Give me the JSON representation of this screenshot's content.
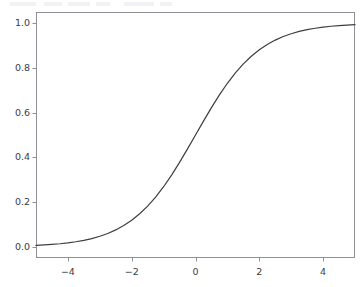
{
  "figure": {
    "width": 363,
    "height": 287,
    "background_color": "#ffffff"
  },
  "top_strip": {
    "present": true,
    "description": "cropped-toolbar-remnant"
  },
  "chart_data": {
    "type": "line",
    "title": "",
    "subtitle": "",
    "xlabel": "",
    "ylabel": "",
    "xlim": [
      -5.0,
      5.0
    ],
    "ylim": [
      -0.0496,
      1.0496
    ],
    "grid": false,
    "legend": null,
    "legend_position": "none",
    "xticks": [
      -4,
      -2,
      0,
      2,
      4
    ],
    "xticklabels": [
      "−4",
      "−2",
      "0",
      "2",
      "4"
    ],
    "yticks": [
      0.0,
      0.2,
      0.4,
      0.6,
      0.8,
      1.0
    ],
    "yticklabels": [
      "0.0",
      "0.2",
      "0.4",
      "0.6",
      "0.8",
      "1.0"
    ],
    "series": [
      {
        "name": "sigmoid",
        "function": "1 / (1 + exp(-x))",
        "color": "#3d3d44",
        "linewidth": 1.2,
        "linestyle": "solid",
        "marker": "none",
        "x": [
          -5.0,
          -4.75,
          -4.5,
          -4.25,
          -4.0,
          -3.75,
          -3.5,
          -3.25,
          -3.0,
          -2.75,
          -2.5,
          -2.25,
          -2.0,
          -1.75,
          -1.5,
          -1.25,
          -1.0,
          -0.75,
          -0.5,
          -0.25,
          0.0,
          0.25,
          0.5,
          0.75,
          1.0,
          1.25,
          1.5,
          1.75,
          2.0,
          2.25,
          2.5,
          2.75,
          3.0,
          3.25,
          3.5,
          3.75,
          4.0,
          4.25,
          4.5,
          4.75,
          5.0
        ],
        "y": [
          0.0067,
          0.0086,
          0.011,
          0.014,
          0.018,
          0.023,
          0.0293,
          0.0373,
          0.0474,
          0.0601,
          0.0759,
          0.0953,
          0.1192,
          0.148,
          0.1824,
          0.2227,
          0.2689,
          0.3208,
          0.3775,
          0.4378,
          0.5,
          0.5622,
          0.6225,
          0.6792,
          0.7311,
          0.7773,
          0.8176,
          0.852,
          0.8808,
          0.9045,
          0.9241,
          0.9399,
          0.9526,
          0.9627,
          0.9707,
          0.977,
          0.982,
          0.986,
          0.989,
          0.9914,
          0.9933
        ]
      }
    ]
  },
  "axes": {
    "spine_color": "#8f8f97",
    "tick_color": "#8f8f97",
    "tick_label_color": "#3b3b42",
    "frame": {
      "left": 36,
      "top": 12,
      "right": 355,
      "bottom": 258
    }
  }
}
